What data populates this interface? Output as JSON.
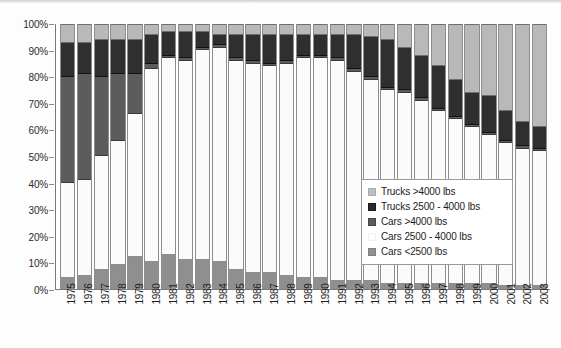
{
  "chart_data": {
    "type": "bar",
    "subtype": "stacked-100-percent",
    "title": "",
    "xlabel": "",
    "ylabel": "",
    "ylim": [
      0,
      100
    ],
    "ytick_labels": [
      "0%",
      "10%",
      "20%",
      "30%",
      "40%",
      "50%",
      "60%",
      "70%",
      "80%",
      "90%",
      "100%"
    ],
    "ytick_values": [
      0,
      10,
      20,
      30,
      40,
      50,
      60,
      70,
      80,
      90,
      100
    ],
    "grid": false,
    "legend_position": "inside-right-center",
    "categories": [
      "1975",
      "1976",
      "1977",
      "1978",
      "1979",
      "1980",
      "1981",
      "1982",
      "1983",
      "1984",
      "1985",
      "1986",
      "1987",
      "1988",
      "1989",
      "1990",
      "1991",
      "1992",
      "1993",
      "1994",
      "1995",
      "1996",
      "1997",
      "1998",
      "1999",
      "2000",
      "2001",
      "2002",
      "2003"
    ],
    "series": [
      {
        "name": "Cars <2500 lbs",
        "color": "#8f8f8f",
        "values": [
          4,
          5,
          7,
          9,
          12,
          10,
          13,
          11,
          11,
          10,
          7,
          6,
          6,
          5,
          4,
          4,
          3,
          3,
          3,
          2,
          2,
          2,
          2,
          2,
          2,
          2,
          1,
          1,
          1
        ]
      },
      {
        "name": "Cars 2500 - 4000 lbs",
        "color": "#fbfbfb",
        "values": [
          36,
          36,
          43,
          47,
          54,
          73,
          74,
          75,
          79,
          81,
          79,
          79,
          78,
          80,
          83,
          83,
          83,
          79,
          76,
          73,
          72,
          69,
          65,
          62,
          59,
          56,
          54,
          52,
          51
        ]
      },
      {
        "name": "Cars >4000 lbs",
        "color": "#5c5c5c",
        "values": [
          40,
          40,
          30,
          25,
          15,
          2,
          1,
          1,
          1,
          1,
          1,
          1,
          1,
          1,
          1,
          1,
          1,
          1,
          1,
          1,
          1,
          1,
          1,
          1,
          1,
          1,
          1,
          1,
          1
        ]
      },
      {
        "name": "Trucks 2500 - 4000 lbs",
        "color": "#2f2f2f",
        "values": [
          13,
          12,
          14,
          13,
          13,
          11,
          9,
          10,
          6,
          4,
          9,
          10,
          11,
          10,
          8,
          8,
          9,
          13,
          15,
          18,
          16,
          16,
          16,
          14,
          12,
          14,
          11,
          9,
          8
        ]
      },
      {
        "name": "Trucks >4000 lbs",
        "color": "#b9b9b9",
        "values": [
          7,
          7,
          6,
          6,
          6,
          4,
          3,
          3,
          3,
          4,
          4,
          4,
          4,
          4,
          4,
          4,
          4,
          4,
          5,
          6,
          9,
          12,
          16,
          21,
          26,
          27,
          33,
          37,
          39
        ]
      }
    ],
    "legend_entries": [
      {
        "label": "Trucks >4000 lbs",
        "swatch_class": "k0"
      },
      {
        "label": "Trucks 2500 - 4000 lbs",
        "swatch_class": "k1"
      },
      {
        "label": "Cars >4000 lbs",
        "swatch_class": "k2"
      },
      {
        "label": "Cars 2500 - 4000 lbs",
        "swatch_class": "k3"
      },
      {
        "label": "Cars <2500 lbs",
        "swatch_class": "k4"
      }
    ]
  }
}
